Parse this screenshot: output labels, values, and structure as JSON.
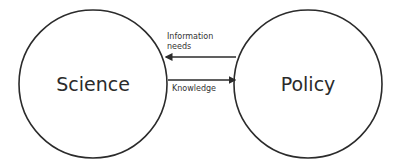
{
  "nodes": [
    {
      "id": "science",
      "label": "Science"
    },
    {
      "id": "policy",
      "label": "Policy"
    }
  ],
  "edges": [
    {
      "from": "policy",
      "to": "science",
      "label": "Information\nneeds"
    },
    {
      "from": "science",
      "to": "policy",
      "label": "Knowledge"
    }
  ],
  "colors": {
    "stroke": "#2b2b2b",
    "background": "#ffffff"
  }
}
